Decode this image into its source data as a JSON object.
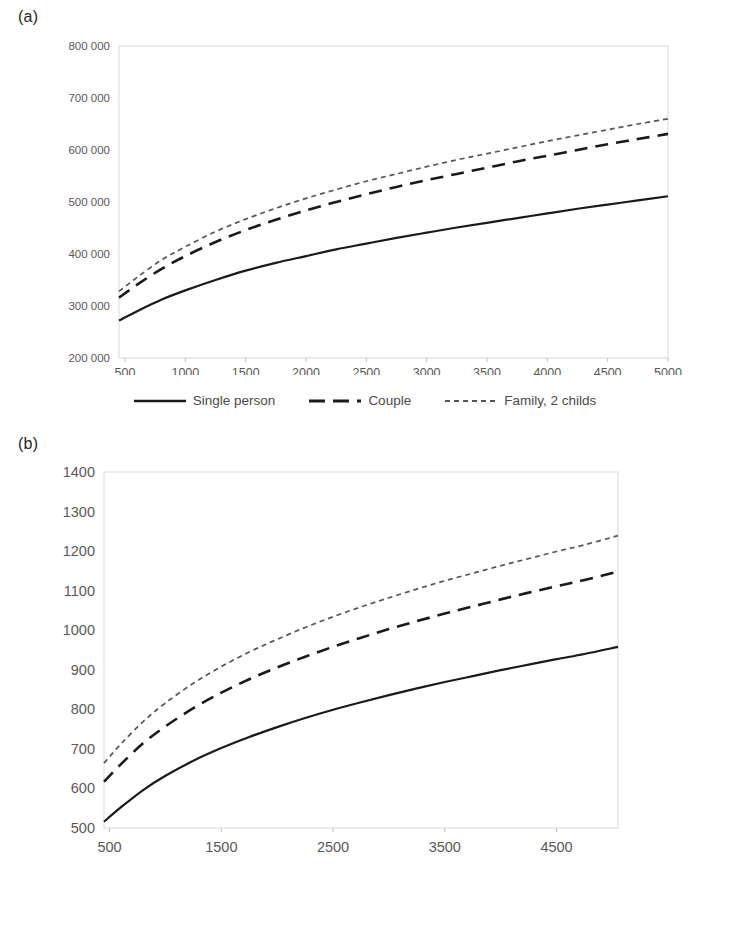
{
  "figure": {
    "panel_a_label": "(a)",
    "panel_b_label": "(b)"
  },
  "legend": {
    "items": [
      {
        "label": "Single person",
        "style": "solid",
        "color": "#1a1a1a"
      },
      {
        "label": "Couple",
        "style": "dashed",
        "color": "#1a1a1a"
      },
      {
        "label": "Family, 2 childs",
        "style": "dotted",
        "color": "#555555"
      }
    ]
  },
  "chart_data": [
    {
      "id": "chart-a",
      "type": "line",
      "title": "(a)",
      "xlabel": "",
      "ylabel": "",
      "xlim": [
        450,
        5000
      ],
      "ylim": [
        200000,
        800000
      ],
      "xticks": [
        500,
        1000,
        1500,
        2000,
        2500,
        3000,
        3500,
        4000,
        4500,
        5000
      ],
      "xtick_labels": [
        "500",
        "1000",
        "1500",
        "2000",
        "2500",
        "3000",
        "3500",
        "4000",
        "4500",
        "5000"
      ],
      "yticks": [
        200000,
        300000,
        400000,
        500000,
        600000,
        700000,
        800000
      ],
      "ytick_labels": [
        "200 000",
        "300 000",
        "400 000",
        "500 000",
        "600 000",
        "700 000",
        "800 000"
      ],
      "grid": false,
      "legend_position": "bottom",
      "x": [
        450,
        600,
        800,
        1000,
        1250,
        1500,
        1750,
        2000,
        2250,
        2500,
        2750,
        3000,
        3250,
        3500,
        3750,
        4000,
        4250,
        4500,
        4750,
        5000
      ],
      "series": [
        {
          "name": "Single person",
          "style": "solid",
          "values": [
            272000,
            290000,
            312000,
            330000,
            350000,
            368000,
            383000,
            396000,
            409000,
            420000,
            431000,
            441000,
            451000,
            460000,
            469000,
            478000,
            487000,
            495000,
            503000,
            511000
          ]
        },
        {
          "name": "Couple",
          "style": "dashed",
          "values": [
            316000,
            341000,
            371000,
            396000,
            423000,
            446000,
            466000,
            484000,
            500000,
            515000,
            529000,
            542000,
            554000,
            566000,
            578000,
            589000,
            600000,
            611000,
            621000,
            631000
          ]
        },
        {
          "name": "Family, 2 childs",
          "style": "dotted",
          "values": [
            328000,
            355000,
            388000,
            414000,
            443000,
            467000,
            488000,
            507000,
            524000,
            540000,
            554000,
            568000,
            581000,
            593000,
            605000,
            617000,
            628000,
            639000,
            650000,
            660000
          ]
        }
      ]
    },
    {
      "id": "chart-b",
      "type": "line",
      "title": "(b)",
      "xlabel": "",
      "ylabel": "",
      "xlim": [
        450,
        5050
      ],
      "ylim": [
        500,
        1400
      ],
      "xticks": [
        500,
        1500,
        2500,
        3500,
        4500
      ],
      "xtick_labels": [
        "500",
        "1500",
        "2500",
        "3500",
        "4500"
      ],
      "yticks": [
        500,
        600,
        700,
        800,
        900,
        1000,
        1100,
        1200,
        1300,
        1400
      ],
      "ytick_labels": [
        "500",
        "600",
        "700",
        "800",
        "900",
        "1000",
        "1100",
        "1200",
        "1300",
        "1400"
      ],
      "grid": false,
      "legend_position": "bottom",
      "x": [
        450,
        600,
        800,
        1000,
        1250,
        1500,
        1750,
        2000,
        2250,
        2500,
        2750,
        3000,
        3250,
        3500,
        3750,
        4000,
        4250,
        4500,
        4750,
        5050
      ],
      "series": [
        {
          "name": "Single person",
          "style": "solid",
          "values": [
            516,
            552,
            596,
            632,
            670,
            702,
            730,
            755,
            778,
            799,
            818,
            836,
            853,
            869,
            884,
            899,
            913,
            927,
            940,
            958
          ]
        },
        {
          "name": "Couple",
          "style": "dashed",
          "values": [
            617,
            661,
            714,
            757,
            803,
            842,
            876,
            906,
            933,
            958,
            981,
            1003,
            1023,
            1042,
            1060,
            1078,
            1095,
            1111,
            1127,
            1148
          ]
        },
        {
          "name": "Family, 2 childs",
          "style": "dotted",
          "values": [
            664,
            712,
            769,
            816,
            866,
            908,
            945,
            977,
            1007,
            1034,
            1059,
            1082,
            1104,
            1125,
            1144,
            1163,
            1181,
            1199,
            1216,
            1239
          ]
        }
      ]
    }
  ]
}
